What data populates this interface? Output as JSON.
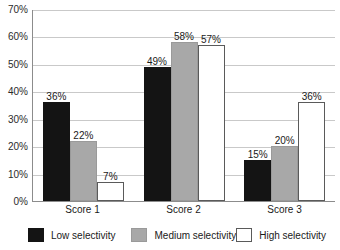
{
  "chart_data": {
    "type": "bar",
    "title": "",
    "subtitle": "",
    "xlabel": "",
    "ylabel": "",
    "grid": true,
    "legend_position": "bottom",
    "categories": [
      "Score 1",
      "Score 2",
      "Score 3"
    ],
    "ylim": [
      0,
      70
    ],
    "ytick_labels": [
      "70%",
      "60%",
      "50%",
      "40%",
      "30%",
      "20%",
      "10%",
      "0%"
    ],
    "ytick_values": [
      70,
      60,
      50,
      40,
      30,
      20,
      10,
      0
    ],
    "series": [
      {
        "name": "Low selectivity",
        "color": "#141414",
        "values": [
          36,
          49,
          15
        ],
        "data_labels": [
          "36%",
          "49%",
          "15%"
        ]
      },
      {
        "name": "Medium selectivity",
        "color": "#a8a8a8",
        "values": [
          22,
          58,
          20
        ],
        "data_labels": [
          "22%",
          "58%",
          "20%"
        ]
      },
      {
        "name": "High selectivity",
        "color": "#ffffff",
        "values": [
          7,
          57,
          36
        ],
        "data_labels": [
          "7%",
          "57%",
          "36%"
        ]
      }
    ]
  }
}
